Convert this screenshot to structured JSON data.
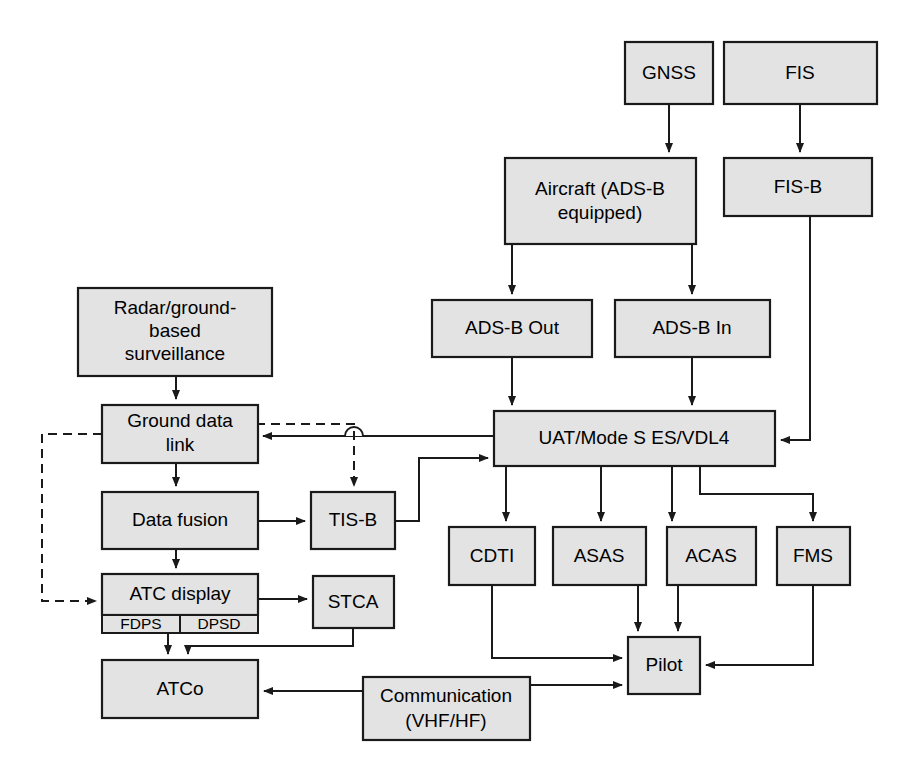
{
  "diagram": {
    "colors": {
      "node_fill": "#e3e3e3",
      "node_stroke": "#1a1a1a",
      "edge": "#1a1a1a",
      "background": "#ffffff"
    },
    "nodes": [
      {
        "id": "gnss",
        "label": "GNSS",
        "x": 625,
        "y": 42,
        "w": 88,
        "h": 62,
        "lines": [
          "GNSS"
        ]
      },
      {
        "id": "fis",
        "label": "FIS",
        "x": 724,
        "y": 42,
        "w": 153,
        "h": 62,
        "lines": [
          "FIS"
        ]
      },
      {
        "id": "aircraft",
        "label": "Aircraft (ADS-B equipped)",
        "x": 505,
        "y": 158,
        "w": 191,
        "h": 86,
        "lines": [
          "Aircraft (ADS-B",
          "equipped)"
        ]
      },
      {
        "id": "fisb",
        "label": "FIS-B",
        "x": 724,
        "y": 158,
        "w": 148,
        "h": 58,
        "lines": [
          "FIS-B"
        ]
      },
      {
        "id": "adsbout",
        "label": "ADS-B Out",
        "x": 432,
        "y": 300,
        "w": 160,
        "h": 57,
        "lines": [
          "ADS-B Out"
        ]
      },
      {
        "id": "adsbin",
        "label": "ADS-B In",
        "x": 615,
        "y": 300,
        "w": 155,
        "h": 57,
        "lines": [
          "ADS-B In"
        ]
      },
      {
        "id": "radar",
        "label": "Radar/ground-based surveillance",
        "x": 78,
        "y": 288,
        "w": 194,
        "h": 88,
        "lines": [
          "Radar/ground-",
          "based",
          "surveillance"
        ]
      },
      {
        "id": "uat",
        "label": "UAT/Mode S ES/VDL4",
        "x": 494,
        "y": 411,
        "w": 281,
        "h": 55,
        "lines": [
          "UAT/Mode S ES/VDL4"
        ]
      },
      {
        "id": "gdl",
        "label": "Ground data link",
        "x": 102,
        "y": 405,
        "w": 156,
        "h": 58,
        "lines": [
          "Ground data",
          "link"
        ]
      },
      {
        "id": "datafusion",
        "label": "Data fusion",
        "x": 102,
        "y": 492,
        "w": 156,
        "h": 57,
        "lines": [
          "Data fusion"
        ]
      },
      {
        "id": "tisb",
        "label": "TIS-B",
        "x": 311,
        "y": 492,
        "w": 84,
        "h": 57,
        "lines": [
          "TIS-B"
        ]
      },
      {
        "id": "cdti",
        "label": "CDTI",
        "x": 449,
        "y": 527,
        "w": 86,
        "h": 58,
        "lines": [
          "CDTI"
        ]
      },
      {
        "id": "asas",
        "label": "ASAS",
        "x": 553,
        "y": 527,
        "w": 93,
        "h": 58,
        "lines": [
          "ASAS"
        ]
      },
      {
        "id": "acas",
        "label": "ACAS",
        "x": 667,
        "y": 527,
        "w": 89,
        "h": 58,
        "lines": [
          "ACAS"
        ]
      },
      {
        "id": "fms",
        "label": "FMS",
        "x": 777,
        "y": 527,
        "w": 73,
        "h": 58,
        "lines": [
          "FMS"
        ]
      },
      {
        "id": "atcdisplay",
        "label": "ATC display",
        "x": 102,
        "y": 574,
        "w": 156,
        "h": 41,
        "lines": [
          "ATC display"
        ]
      },
      {
        "id": "stca",
        "label": "STCA",
        "x": 313,
        "y": 576,
        "w": 81,
        "h": 52,
        "lines": [
          "STCA"
        ]
      },
      {
        "id": "pilot",
        "label": "Pilot",
        "x": 628,
        "y": 637,
        "w": 72,
        "h": 57,
        "lines": [
          "Pilot"
        ]
      },
      {
        "id": "atco",
        "label": "ATCo",
        "x": 102,
        "y": 660,
        "w": 156,
        "h": 58,
        "lines": [
          "ATCo"
        ]
      },
      {
        "id": "comm",
        "label": "Communication (VHF/HF)",
        "x": 363,
        "y": 677,
        "w": 167,
        "h": 63,
        "lines": [
          "Communication",
          "(VHF/HF)"
        ]
      }
    ],
    "sub_nodes": [
      {
        "id": "fdps",
        "parent": "atcdisplay",
        "label": "FDPS",
        "x": 102,
        "y": 615,
        "w": 78,
        "h": 18
      },
      {
        "id": "dpsd",
        "parent": "atcdisplay",
        "label": "DPSD",
        "x": 180,
        "y": 615,
        "w": 78,
        "h": 18
      }
    ],
    "edges": [
      {
        "id": "e-gnss-aircraft",
        "from": "gnss",
        "to": "aircraft",
        "style": "solid",
        "arrow": true
      },
      {
        "id": "e-fis-fisb",
        "from": "fis",
        "to": "fisb",
        "style": "solid",
        "arrow": true
      },
      {
        "id": "e-aircraft-adsbout",
        "from": "aircraft",
        "to": "adsbout",
        "style": "solid",
        "arrow": true
      },
      {
        "id": "e-aircraft-adsbin",
        "from": "aircraft",
        "to": "adsbin",
        "style": "solid",
        "arrow": true
      },
      {
        "id": "e-adsbout-uat",
        "from": "adsbout",
        "to": "uat",
        "style": "solid",
        "arrow": true
      },
      {
        "id": "e-adsbin-uat",
        "from": "adsbin",
        "to": "uat",
        "style": "solid",
        "arrow": true
      },
      {
        "id": "e-fisb-uat",
        "from": "fisb",
        "to": "uat",
        "style": "solid",
        "arrow": true
      },
      {
        "id": "e-radar-gdl",
        "from": "radar",
        "to": "gdl",
        "style": "solid",
        "arrow": true
      },
      {
        "id": "e-uat-gdl",
        "from": "uat",
        "to": "gdl",
        "style": "solid",
        "arrow": true
      },
      {
        "id": "e-gdl-tisb",
        "from": "gdl",
        "to": "tisb",
        "style": "dashed",
        "arrow": true
      },
      {
        "id": "e-gdl-atcdisplay",
        "from": "gdl",
        "to": "atcdisplay",
        "style": "dashed",
        "arrow": true
      },
      {
        "id": "e-gdl-datafusion",
        "from": "gdl",
        "to": "datafusion",
        "style": "solid",
        "arrow": true
      },
      {
        "id": "e-datafusion-tisb",
        "from": "datafusion",
        "to": "tisb",
        "style": "solid",
        "arrow": true
      },
      {
        "id": "e-tisb-uat",
        "from": "tisb",
        "to": "uat",
        "style": "solid",
        "arrow": true
      },
      {
        "id": "e-datafusion-atcd",
        "from": "datafusion",
        "to": "atcdisplay",
        "style": "solid",
        "arrow": true
      },
      {
        "id": "e-atcdisplay-stca",
        "from": "atcdisplay",
        "to": "stca",
        "style": "solid",
        "arrow": true
      },
      {
        "id": "e-atcdisplay-atco",
        "from": "atcdisplay",
        "to": "atco",
        "style": "solid",
        "arrow": true
      },
      {
        "id": "e-stca-atco",
        "from": "stca",
        "to": "atco",
        "style": "solid",
        "arrow": true
      },
      {
        "id": "e-uat-cdti",
        "from": "uat",
        "to": "cdti",
        "style": "solid",
        "arrow": true
      },
      {
        "id": "e-uat-asas",
        "from": "uat",
        "to": "asas",
        "style": "solid",
        "arrow": true
      },
      {
        "id": "e-uat-acas",
        "from": "uat",
        "to": "acas",
        "style": "solid",
        "arrow": true
      },
      {
        "id": "e-uat-fms",
        "from": "uat",
        "to": "fms",
        "style": "solid",
        "arrow": true
      },
      {
        "id": "e-cdti-pilot",
        "from": "cdti",
        "to": "pilot",
        "style": "solid",
        "arrow": true
      },
      {
        "id": "e-asas-pilot",
        "from": "asas",
        "to": "pilot",
        "style": "solid",
        "arrow": true
      },
      {
        "id": "e-acas-pilot",
        "from": "acas",
        "to": "pilot",
        "style": "solid",
        "arrow": true
      },
      {
        "id": "e-fms-pilot",
        "from": "fms",
        "to": "pilot",
        "style": "solid",
        "arrow": true
      },
      {
        "id": "e-comm-atco",
        "from": "comm",
        "to": "atco",
        "style": "solid",
        "arrow": true
      },
      {
        "id": "e-comm-pilot",
        "from": "comm",
        "to": "pilot",
        "style": "solid",
        "arrow": true
      }
    ]
  }
}
